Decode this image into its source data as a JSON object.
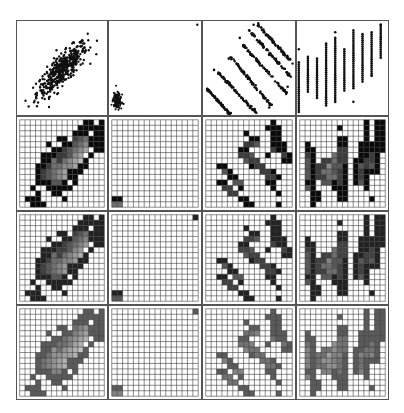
{
  "figure": {
    "type": "scatterplot-matrix-with-binned-heatmaps",
    "rows": 4,
    "cols": 4,
    "grid_bins": 16
  },
  "colors": {
    "frame": "#555555",
    "points": "#111111",
    "grid_line": "#333333",
    "row2_palette": [
      "#ffffff",
      "#d8d8d8",
      "#bdbdbd",
      "#a3a3a3",
      "#8a8a8a",
      "#707070",
      "#575757",
      "#3d3d3d",
      "#242424",
      "#0a0a0a"
    ],
    "row3_palette": [
      "#ffffff",
      "#dcdcdc",
      "#c6c6c6",
      "#b0b0b0",
      "#9a9a9a",
      "#848484",
      "#6e6e6e",
      "#585858",
      "#424242",
      "#222222"
    ],
    "row4_palette": [
      "#ffffff",
      "#e2e2e2",
      "#d2d2d2",
      "#c2c2c2",
      "#b2b2b2",
      "#a2a2a2",
      "#929292",
      "#828282",
      "#727272",
      "#5a5a5a"
    ]
  },
  "chart_data": [
    {
      "type": "scatter",
      "panel": "r1c1",
      "description": "positively correlated elliptical cloud",
      "x_range": [
        0,
        1
      ],
      "y_range": [
        0,
        1
      ]
    },
    {
      "type": "scatter",
      "panel": "r1c2",
      "description": "tight cluster at bottom-left plus single outlier top-right"
    },
    {
      "type": "scatter",
      "panel": "r1c3",
      "description": "six parallel negatively sloped bands"
    },
    {
      "type": "scatter",
      "panel": "r1c4",
      "description": "discrete vertical strips increasing upward"
    },
    {
      "type": "heatmap",
      "panel": "r2c1",
      "bins": 16,
      "rows": [
        "0000000000009909",
        "0000000000099999",
        "0000000000999099",
        "0000000990765999",
        "0000090099654999",
        "0000009976543099",
        "0000999776430900",
        "0000995754329000",
        "0009975544399000",
        "0009765439990000",
        "0009765439900000",
        "0009996690900000",
        "0090099999000000",
        "0009009900000000",
        "0999000090000000",
        "0099900000000000"
      ]
    },
    {
      "type": "heatmap",
      "panel": "r2c2",
      "bins": 16,
      "rows": [
        "0000000000000000",
        "0000000000000000",
        "0000000000000000",
        "0000000000000000",
        "0000000000000000",
        "0000000000000000",
        "0000000000000000",
        "0000000000000000",
        "0000000000000000",
        "0000000000000000",
        "0000000000000000",
        "0000000000000000",
        "0000000000000000",
        "0000000000000000",
        "9900000000000000",
        "5500000000000000"
      ]
    },
    {
      "type": "heatmap",
      "panel": "r2c3",
      "bins": 16,
      "rows": [
        "0000000000009000",
        "0000000000099900",
        "0000000900009900",
        "0000000099009900",
        "0000000776009990",
        "0000009900007990",
        "0000007760090079",
        "0000000677000099",
        "0099000097700000",
        "0006900000779000",
        "0000990000077900",
        "0099066000099000",
        "0007709000009000",
        "0000770000000900",
        "0000009900000000",
        "0000000990000900"
      ]
    },
    {
      "type": "heatmap",
      "panel": "r2c4",
      "bins": 16,
      "rows": [
        "0000000000009099",
        "0000000900009099",
        "0000000000009099",
        "0000000990009099",
        "0900000990099999",
        "0990000770099999",
        "0790005770099790",
        "0690775770997790",
        "0697746690967690",
        "0697556790979990",
        "0697755790979000",
        "0990669790969000",
        "0690009990009000",
        "0099000990000000",
        "0099000990000900",
        "0090000000000000"
      ]
    },
    {
      "type": "heatmap",
      "panel": "r3c1",
      "bins": 16,
      "rows": [
        "0000000000009909",
        "0000000000099999",
        "0000000000999099",
        "0000000990876999",
        "0000090099765999",
        "0000009987654099",
        "0000999887540900",
        "0000996865439000",
        "0009986655499000",
        "0009876549990000",
        "0009876549900000",
        "0009997790900000",
        "0090099999000000",
        "0009009900000000",
        "0999000090000000",
        "0099900000000000"
      ]
    },
    {
      "type": "heatmap",
      "panel": "r3c2",
      "bins": 16,
      "rows": [
        "0000000000000009",
        "0000000000000000",
        "0000000000000000",
        "0000000000000000",
        "0000000000000000",
        "0000000000000000",
        "0000000000000000",
        "0000000000000000",
        "0000000000000000",
        "0000000000000000",
        "0000000000000000",
        "0000000000000000",
        "0000000000000000",
        "0000000000000000",
        "9900000000000000",
        "7700000000000000"
      ]
    },
    {
      "type": "heatmap",
      "panel": "r3c3",
      "bins": 16,
      "rows": [
        "0000000000009000",
        "0000000000099900",
        "0000000900009900",
        "0000000099009900",
        "0000000887009990",
        "0000009900008990",
        "0000008870090089",
        "0000000788000099",
        "0099000098800000",
        "0007900000889000",
        "0000990000088900",
        "0099077000099000",
        "0008809000009000",
        "0000880000000900",
        "0000009900000000",
        "0000000990000900"
      ]
    },
    {
      "type": "heatmap",
      "panel": "r3c4",
      "bins": 16,
      "rows": [
        "0000000000009099",
        "0000000900009099",
        "0000000000009099",
        "0000000990009099",
        "0900000990099999",
        "0990000880099999",
        "0890006880099890",
        "0790886880998890",
        "0798857790978790",
        "0798667890989990",
        "0798866890989000",
        "0990779890979000",
        "0790009990009000",
        "0099000990000000",
        "0099000990000900",
        "0090000000000000"
      ]
    },
    {
      "type": "heatmap",
      "panel": "r4c1",
      "bins": 16,
      "rows": [
        "0000000000009909",
        "0000000000099999",
        "0000000000999099",
        "0000000990876999",
        "0000090099765999",
        "0000009987654099",
        "0000999887540900",
        "0000996865439000",
        "0009986655499000",
        "0009876549990000",
        "0009876549900000",
        "0009997790900000",
        "0090099999000000",
        "0009009900000000",
        "0999000090000000",
        "0099900000000000"
      ]
    },
    {
      "type": "heatmap",
      "panel": "r4c2",
      "bins": 16,
      "rows": [
        "0000000000000009",
        "0000000000000000",
        "0000000000000000",
        "0000000000000000",
        "0000000000000000",
        "0000000000000000",
        "0000000000000000",
        "0000000000000000",
        "0000000000000000",
        "0000000000000000",
        "0000000000000000",
        "0000000000000000",
        "0000000000000000",
        "0000000000000000",
        "9900000000000000",
        "7700000000000000"
      ]
    },
    {
      "type": "heatmap",
      "panel": "r4c3",
      "bins": 16,
      "rows": [
        "0000000000009000",
        "0000000000099900",
        "0000000900009900",
        "0000000099009900",
        "0000000887009990",
        "0000009900008990",
        "0000008870090089",
        "0000000788000099",
        "0099000098800000",
        "0007900000889000",
        "0000990000088900",
        "0099077000099000",
        "0008809000009000",
        "0000880000000900",
        "0000009900000000",
        "0000000990000900"
      ]
    },
    {
      "type": "heatmap",
      "panel": "r4c4",
      "bins": 16,
      "rows": [
        "0000000000009099",
        "0000000900009099",
        "0000000000009099",
        "0000000990009099",
        "0900000990099999",
        "0990000880099999",
        "0890006880099890",
        "0790886880998890",
        "0798857790978790",
        "0798667890989990",
        "0798866890989000",
        "0990779890979000",
        "0790009990009000",
        "0099000990000000",
        "0099000990000900",
        "0090000000000000"
      ]
    }
  ]
}
